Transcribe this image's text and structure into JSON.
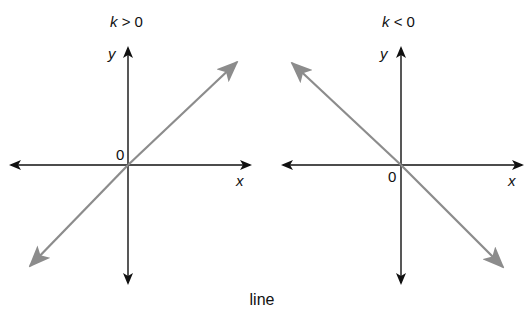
{
  "caption": "line",
  "colors": {
    "axis": "#111111",
    "line": "#8c8c8c",
    "background": "#ffffff"
  },
  "panels": [
    {
      "title_var": "k",
      "title_rel": " > 0",
      "x_label": "x",
      "y_label": "y",
      "origin_label": "0",
      "slope": "positive"
    },
    {
      "title_var": "k",
      "title_rel": " < 0",
      "x_label": "x",
      "y_label": "y",
      "origin_label": "0",
      "slope": "negative"
    }
  ]
}
